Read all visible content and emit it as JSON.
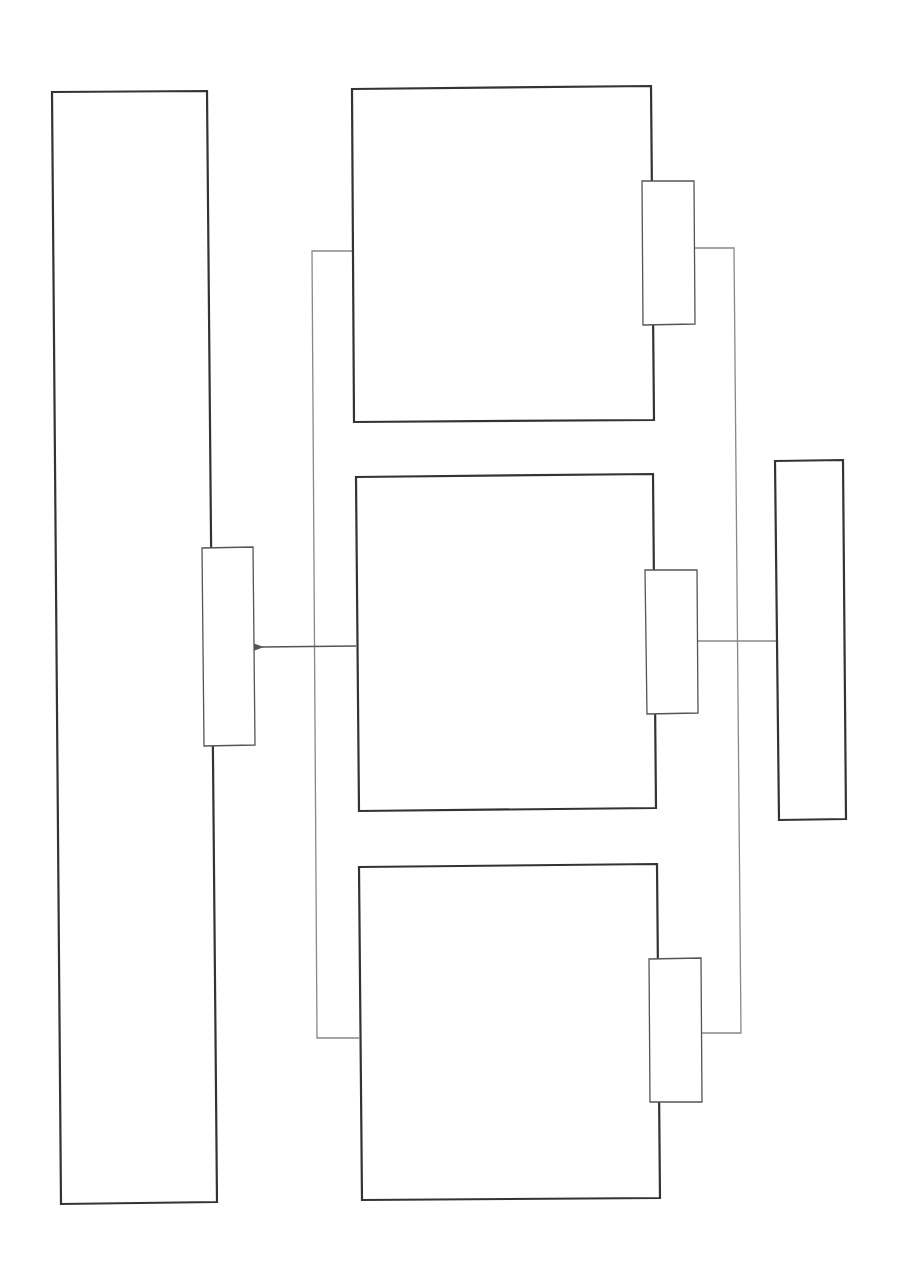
{
  "diagram": {
    "title": "",
    "colors": {
      "background": "#ffffff",
      "box_stroke": "#333333",
      "port_stroke": "#555555",
      "connector_stroke": "#888888",
      "arrow_stroke": "#555555"
    },
    "nodes": [
      {
        "id": "left-panel",
        "label": "",
        "x": 52,
        "y": 92,
        "w": 160,
        "h": 1112
      },
      {
        "id": "left-panel-port",
        "label": "",
        "x": 202,
        "y": 547,
        "w": 52,
        "h": 198
      },
      {
        "id": "box-top",
        "label": "",
        "x": 352,
        "y": 88,
        "w": 300,
        "h": 334
      },
      {
        "id": "box-top-port",
        "label": "",
        "x": 643,
        "y": 181,
        "w": 52,
        "h": 143
      },
      {
        "id": "box-middle",
        "label": "",
        "x": 356,
        "y": 476,
        "w": 300,
        "h": 334
      },
      {
        "id": "box-middle-port",
        "label": "",
        "x": 646,
        "y": 570,
        "w": 52,
        "h": 143
      },
      {
        "id": "box-bottom",
        "label": "",
        "x": 359,
        "y": 864,
        "w": 300,
        "h": 336
      },
      {
        "id": "box-bottom-port",
        "label": "",
        "x": 649,
        "y": 959,
        "w": 52,
        "h": 143
      },
      {
        "id": "right-panel",
        "label": "",
        "x": 775,
        "y": 460,
        "w": 69,
        "h": 360
      }
    ],
    "edges": [
      {
        "id": "middle-to-left-arrow",
        "from": "box-middle",
        "to": "left-panel-port",
        "arrow": true
      },
      {
        "id": "left-bus",
        "from": "box-top",
        "to": "box-bottom",
        "arrow": false
      },
      {
        "id": "right-bus",
        "from": "box-top-port",
        "to": "box-bottom-port",
        "arrow": false
      },
      {
        "id": "middle-port-to-right-panel",
        "from": "box-middle-port",
        "to": "right-panel",
        "arrow": false
      }
    ]
  }
}
